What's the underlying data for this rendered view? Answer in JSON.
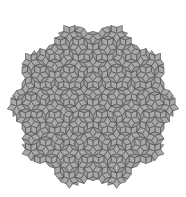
{
  "figure": {
    "type": "penrose-rhombus-tiling",
    "background": "#ffffff",
    "tile_fill": "#9c9c9c",
    "tile_fill_thin": "#a6a6a6",
    "edge_color": "#3a3a3a",
    "center": [
      93,
      106
    ],
    "radius": 78,
    "deflations": 6
  }
}
